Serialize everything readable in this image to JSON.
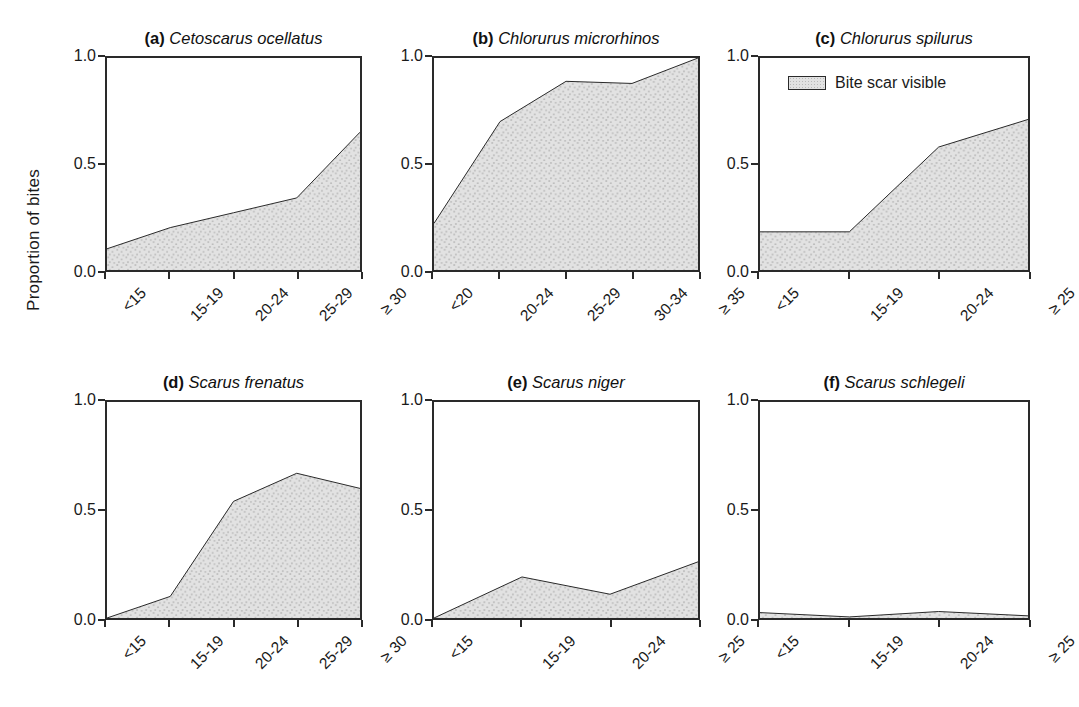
{
  "figure": {
    "ylabel": "Proportion of bites",
    "legend": {
      "label": "Bite scar visible",
      "swatch_fill": "#e2e2e2",
      "swatch_border": "#2a2a2a",
      "panel": "c"
    },
    "style": {
      "area_fill": "#e2e2e2",
      "line_color": "#2a2a2a",
      "axis_color": "#2a2a2a",
      "background": "#ffffff"
    }
  },
  "chart_data": [
    {
      "type": "area",
      "panel_letter": "(a)",
      "title": "Cetoscarus ocellatus",
      "categories": [
        "<15",
        "15-19",
        "20-24",
        "25-29",
        "≥ 30"
      ],
      "values": [
        0.1,
        0.2,
        0.27,
        0.34,
        0.65
      ],
      "xlabel": "",
      "ylabel": "Proportion of bites",
      "ylim": [
        0.0,
        1.0
      ],
      "yticks": [
        "0.0",
        "0.5",
        "1.0"
      ],
      "ytick_values": [
        0.0,
        0.5,
        1.0
      ],
      "grid": false,
      "legend": false
    },
    {
      "type": "area",
      "panel_letter": "(b)",
      "title": "Chlorurus microrhinos",
      "categories": [
        "<20",
        "20-24",
        "25-29",
        "30-34",
        "≥ 35"
      ],
      "values": [
        0.22,
        0.7,
        0.89,
        0.88,
        1.0
      ],
      "xlabel": "",
      "ylabel": "",
      "ylim": [
        0.0,
        1.0
      ],
      "yticks": [
        "0.0",
        "0.5",
        "1.0"
      ],
      "ytick_values": [
        0.0,
        0.5,
        1.0
      ],
      "grid": false,
      "legend": false
    },
    {
      "type": "area",
      "panel_letter": "(c)",
      "title": "Chlorurus spilurus",
      "categories": [
        "<15",
        "15-19",
        "20-24",
        "≥ 25"
      ],
      "values": [
        0.18,
        0.18,
        0.58,
        0.71
      ],
      "xlabel": "",
      "ylabel": "",
      "ylim": [
        0.0,
        1.0
      ],
      "yticks": [
        "0.0",
        "0.5",
        "1.0"
      ],
      "ytick_values": [
        0.0,
        0.5,
        1.0
      ],
      "grid": false,
      "legend": true,
      "legend_position": "upper left"
    },
    {
      "type": "area",
      "panel_letter": "(d)",
      "title": "Scarus frenatus",
      "categories": [
        "<15",
        "15-19",
        "20-24",
        "25-29",
        "≥ 30"
      ],
      "values": [
        0.0,
        0.1,
        0.54,
        0.67,
        0.6
      ],
      "xlabel": "",
      "ylabel": "Proportion of bites",
      "ylim": [
        0.0,
        1.0
      ],
      "yticks": [
        "0.0",
        "0.5",
        "1.0"
      ],
      "ytick_values": [
        0.0,
        0.5,
        1.0
      ],
      "grid": false,
      "legend": false
    },
    {
      "type": "area",
      "panel_letter": "(e)",
      "title": "Scarus niger",
      "categories": [
        "<15",
        "15-19",
        "20-24",
        "≥ 25"
      ],
      "values": [
        0.0,
        0.19,
        0.11,
        0.26
      ],
      "xlabel": "",
      "ylabel": "",
      "ylim": [
        0.0,
        1.0
      ],
      "yticks": [
        "0.0",
        "0.5",
        "1.0"
      ],
      "ytick_values": [
        0.0,
        0.5,
        1.0
      ],
      "grid": false,
      "legend": false
    },
    {
      "type": "area",
      "panel_letter": "(f)",
      "title": "Scarus schlegeli",
      "categories": [
        "<15",
        "15-19",
        "20-24",
        "≥ 25"
      ],
      "values": [
        0.025,
        0.005,
        0.03,
        0.01
      ],
      "xlabel": "",
      "ylabel": "",
      "ylim": [
        0.0,
        1.0
      ],
      "yticks": [
        "0.0",
        "0.5",
        "1.0"
      ],
      "ytick_values": [
        0.0,
        0.5,
        1.0
      ],
      "grid": false,
      "legend": false
    }
  ]
}
